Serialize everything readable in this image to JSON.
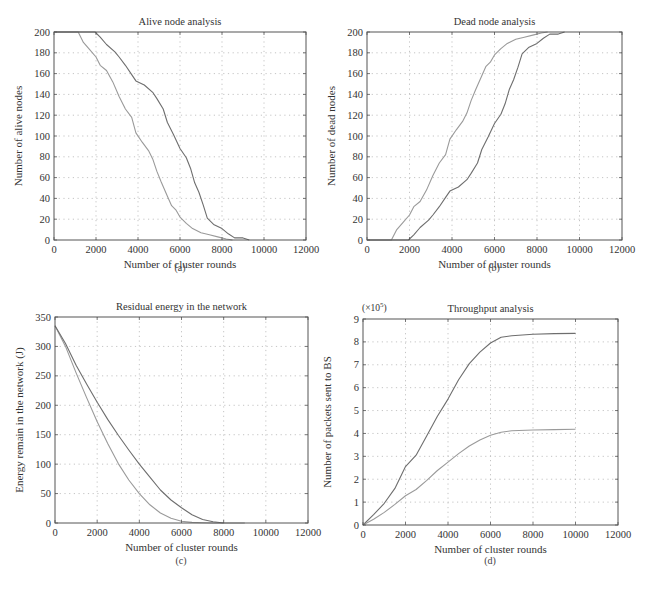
{
  "figure": {
    "captions": [
      "(a)",
      "(b)",
      "(c)",
      "(d)"
    ]
  },
  "colors": {
    "series_dark": "#6e6e6e",
    "series_light": "#9a9a9a",
    "grid": "#b5b5b5",
    "axis": "#555555"
  },
  "chart_data": [
    {
      "id": "a",
      "type": "line",
      "title": "Alive node analysis",
      "xlabel": "Number of cluster rounds",
      "ylabel": "Number of alive nodes",
      "xlim": [
        0,
        12000
      ],
      "ylim": [
        0,
        200
      ],
      "xticks": [
        0,
        2000,
        4000,
        6000,
        8000,
        10000,
        12000
      ],
      "yticks": [
        0,
        20,
        40,
        60,
        80,
        100,
        120,
        140,
        160,
        180,
        200
      ],
      "grid": true,
      "legend": null,
      "series": [
        {
          "name": "series-light",
          "style": "light",
          "x": [
            0,
            1150,
            1400,
            1700,
            2000,
            2200,
            2500,
            2800,
            3100,
            3400,
            3700,
            3900,
            4200,
            4500,
            4700,
            4900,
            5100,
            5400,
            5600,
            5800,
            6000,
            6300,
            6600,
            7000,
            7400,
            7800,
            8200,
            8500
          ],
          "y": [
            200,
            200,
            190,
            183,
            176,
            168,
            163,
            152,
            138,
            126,
            118,
            103,
            94,
            86,
            78,
            66,
            56,
            42,
            33,
            29,
            22,
            16,
            11,
            7,
            5,
            3,
            1,
            0
          ]
        },
        {
          "name": "series-dark",
          "style": "dark",
          "x": [
            0,
            1950,
            2200,
            2500,
            2900,
            3100,
            3400,
            3700,
            3900,
            4300,
            4700,
            4900,
            5200,
            5400,
            5700,
            6000,
            6300,
            6500,
            6700,
            6900,
            7100,
            7300,
            7600,
            8000,
            8300,
            8600,
            9000,
            9300
          ],
          "y": [
            200,
            200,
            195,
            188,
            181,
            176,
            168,
            159,
            153,
            149,
            142,
            136,
            126,
            113,
            101,
            88,
            79,
            69,
            55,
            46,
            34,
            21,
            15,
            11,
            6,
            2,
            2,
            0
          ]
        }
      ]
    },
    {
      "id": "b",
      "type": "line",
      "title": "Dead node analysis",
      "xlabel": "Number of cluster rounds",
      "ylabel": "Number of dead nodes",
      "xlim": [
        0,
        12000
      ],
      "ylim": [
        0,
        200
      ],
      "xticks": [
        0,
        2000,
        4000,
        6000,
        8000,
        10000,
        12000
      ],
      "yticks": [
        0,
        20,
        40,
        60,
        80,
        100,
        120,
        140,
        160,
        180,
        200
      ],
      "grid": true,
      "legend": null,
      "series": [
        {
          "name": "series-light",
          "style": "light",
          "x": [
            0,
            1150,
            1400,
            1700,
            2000,
            2200,
            2500,
            2800,
            3100,
            3400,
            3700,
            3900,
            4200,
            4500,
            4700,
            4900,
            5100,
            5400,
            5600,
            5800,
            6000,
            6300,
            6600,
            7000,
            7400,
            7800,
            8200,
            8500
          ],
          "y": [
            0,
            0,
            10,
            17,
            24,
            32,
            37,
            48,
            62,
            74,
            82,
            97,
            106,
            114,
            122,
            134,
            144,
            158,
            167,
            171,
            178,
            184,
            189,
            193,
            195,
            197,
            199,
            200
          ]
        },
        {
          "name": "series-dark",
          "style": "dark",
          "x": [
            0,
            1950,
            2200,
            2500,
            2900,
            3100,
            3400,
            3700,
            3900,
            4300,
            4700,
            4900,
            5200,
            5400,
            5700,
            6000,
            6300,
            6500,
            6700,
            6900,
            7100,
            7300,
            7600,
            8000,
            8300,
            8600,
            9000,
            9300
          ],
          "y": [
            0,
            0,
            5,
            12,
            19,
            24,
            32,
            41,
            47,
            51,
            58,
            64,
            74,
            87,
            99,
            112,
            121,
            131,
            145,
            154,
            166,
            179,
            185,
            189,
            194,
            198,
            198,
            200
          ]
        }
      ]
    },
    {
      "id": "c",
      "type": "line",
      "title": "Residual energy in the network",
      "xlabel": "Number of cluster rounds",
      "ylabel": "Energy remain in the network (J)",
      "xlim": [
        0,
        12000
      ],
      "ylim": [
        0,
        350
      ],
      "xticks": [
        0,
        2000,
        4000,
        6000,
        8000,
        10000,
        12000
      ],
      "yticks": [
        0,
        50,
        100,
        150,
        200,
        250,
        300,
        350
      ],
      "grid": true,
      "legend": null,
      "series": [
        {
          "name": "series-light",
          "style": "light",
          "x": [
            0,
            500,
            1000,
            1500,
            2000,
            2500,
            3000,
            3500,
            4000,
            4500,
            5000,
            5500,
            6000,
            6500,
            7000,
            7500,
            8000,
            9000
          ],
          "y": [
            335,
            300,
            255,
            213,
            172,
            135,
            101,
            73,
            50,
            31,
            17,
            8,
            3,
            1,
            0.5,
            0,
            0,
            0
          ]
        },
        {
          "name": "series-dark",
          "style": "dark",
          "x": [
            0,
            500,
            1000,
            1500,
            2000,
            2500,
            3000,
            3500,
            4000,
            4500,
            5000,
            5500,
            6000,
            6500,
            7000,
            7500,
            8000
          ],
          "y": [
            335,
            305,
            268,
            236,
            205,
            176,
            149,
            124,
            100,
            78,
            56,
            39,
            26,
            14,
            6,
            2,
            0
          ]
        }
      ]
    },
    {
      "id": "d",
      "type": "line",
      "title": "Throughput analysis",
      "xlabel": "Number of cluster rounds",
      "ylabel": "Number of packets sent to BS",
      "y_multiplier_label": "(×10^5)",
      "xlim": [
        0,
        12000
      ],
      "ylim": [
        0,
        9
      ],
      "xticks": [
        0,
        2000,
        4000,
        6000,
        8000,
        10000,
        12000
      ],
      "yticks": [
        0,
        1,
        2,
        3,
        4,
        5,
        6,
        7,
        8,
        9
      ],
      "grid": true,
      "legend": null,
      "series": [
        {
          "name": "series-dark",
          "style": "dark",
          "x": [
            0,
            500,
            1000,
            1500,
            2000,
            2500,
            3000,
            3500,
            4000,
            4500,
            5000,
            5500,
            6000,
            6500,
            7000,
            8000,
            9000,
            10000
          ],
          "y": [
            0,
            0.45,
            0.95,
            1.6,
            2.55,
            3.05,
            3.9,
            4.75,
            5.5,
            6.35,
            7.05,
            7.55,
            7.95,
            8.2,
            8.27,
            8.33,
            8.36,
            8.37
          ]
        },
        {
          "name": "series-light",
          "style": "light",
          "x": [
            0,
            500,
            1000,
            1500,
            2000,
            2500,
            3000,
            3500,
            4000,
            4500,
            5000,
            5500,
            6000,
            6500,
            7000,
            8000,
            9000,
            10000
          ],
          "y": [
            0,
            0.25,
            0.55,
            0.9,
            1.28,
            1.55,
            1.95,
            2.38,
            2.75,
            3.12,
            3.45,
            3.72,
            3.92,
            4.05,
            4.12,
            4.15,
            4.17,
            4.18
          ]
        }
      ]
    }
  ]
}
